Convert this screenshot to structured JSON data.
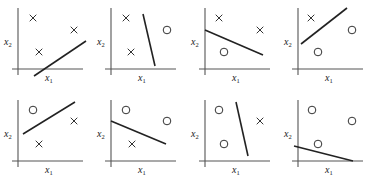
{
  "figure": {
    "axis_labels": {
      "x": "x",
      "x_sub": "1",
      "y": "x",
      "y_sub": "2"
    },
    "colors": {
      "axis": "#555555",
      "boundary": "#222222",
      "marker": "#333333"
    },
    "panels": [
      {
        "id": 1,
        "origin": [
          18,
          69
        ],
        "crosses": [
          [
            33,
            18
          ],
          [
            74,
            30
          ],
          [
            39,
            52
          ]
        ],
        "circles": [],
        "line": [
          [
            34,
            76
          ],
          [
            86,
            41
          ]
        ]
      },
      {
        "id": 2,
        "origin": [
          111,
          69
        ],
        "crosses": [
          [
            126,
            18
          ],
          [
            131,
            52
          ]
        ],
        "circles": [
          [
            167,
            30
          ]
        ],
        "line": [
          [
            143,
            14
          ],
          [
            155,
            66
          ]
        ]
      },
      {
        "id": 3,
        "origin": [
          205,
          69
        ],
        "crosses": [
          [
            219,
            18
          ],
          [
            260,
            30
          ]
        ],
        "circles": [
          [
            224,
            52
          ]
        ],
        "line": [
          [
            205,
            30
          ],
          [
            263,
            55
          ]
        ]
      },
      {
        "id": 4,
        "origin": [
          298,
          69
        ],
        "crosses": [
          [
            311,
            18
          ]
        ],
        "circles": [
          [
            352,
            30
          ],
          [
            318,
            52
          ]
        ],
        "line": [
          [
            301,
            44
          ],
          [
            347,
            8
          ]
        ]
      },
      {
        "id": 5,
        "origin": [
          18,
          161
        ],
        "crosses": [
          [
            74,
            121
          ],
          [
            39,
            144
          ]
        ],
        "circles": [
          [
            33,
            110
          ]
        ],
        "line": [
          [
            23,
            134
          ],
          [
            75,
            102
          ]
        ]
      },
      {
        "id": 6,
        "origin": [
          111,
          161
        ],
        "crosses": [
          [
            132,
            144
          ]
        ],
        "circles": [
          [
            126,
            110
          ],
          [
            167,
            121
          ]
        ],
        "line": [
          [
            111,
            121
          ],
          [
            166,
            144
          ]
        ]
      },
      {
        "id": 7,
        "origin": [
          205,
          161
        ],
        "crosses": [
          [
            260,
            121
          ]
        ],
        "circles": [
          [
            219,
            110
          ],
          [
            224,
            144
          ]
        ],
        "line": [
          [
            236,
            102
          ],
          [
            248,
            156
          ]
        ]
      },
      {
        "id": 8,
        "origin": [
          298,
          161
        ],
        "crosses": [],
        "circles": [
          [
            312,
            110
          ],
          [
            352,
            121
          ],
          [
            318,
            144
          ]
        ],
        "line": [
          [
            294,
            146
          ],
          [
            353,
            161
          ]
        ]
      }
    ]
  }
}
